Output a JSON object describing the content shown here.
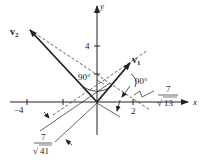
{
  "diagram": {
    "axes": {
      "x_label": "x",
      "y_label": "y",
      "x_tick_labels": [
        "−4",
        "2"
      ],
      "y_tick_labels": [
        "4"
      ]
    },
    "vectors": [
      {
        "name": "v1",
        "label": "v",
        "subscript": "1"
      },
      {
        "name": "v2",
        "label": "v",
        "subscript": "2"
      }
    ],
    "angles": [
      "90°",
      "90°"
    ],
    "distances": [
      {
        "numerator": "7",
        "denominator": "13"
      },
      {
        "numerator": "7",
        "denominator": "41"
      }
    ],
    "colors": {
      "ink": "#222222",
      "background": "#ffffff"
    }
  }
}
